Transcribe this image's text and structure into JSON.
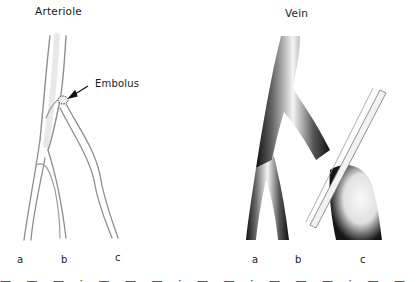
{
  "figure": {
    "panels": [
      {
        "id": "arteriole",
        "title": "Arteriole",
        "annotation": "Embolus",
        "branch_labels": [
          "a",
          "b",
          "c"
        ]
      },
      {
        "id": "vein",
        "title": "Vein",
        "branch_labels": [
          "a",
          "b",
          "c"
        ]
      }
    ],
    "caption_partial": "— — — · — — — · — — ·  — — — · — — — · — — —"
  }
}
